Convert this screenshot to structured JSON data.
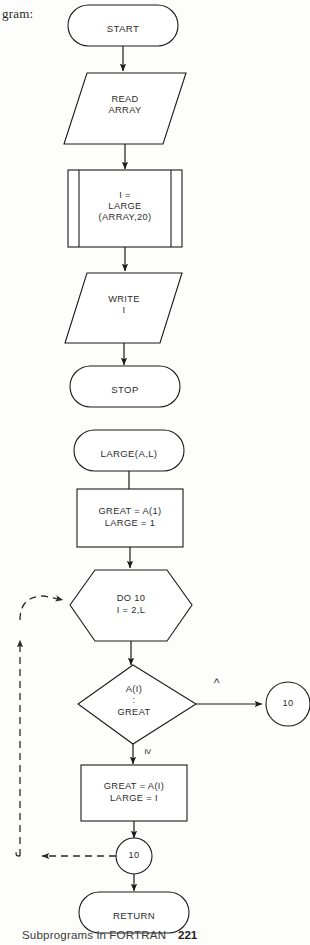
{
  "page": {
    "caption_fragment": "gram:",
    "footer_title": "Subprograms in FORTRAN",
    "footer_page": "221"
  },
  "main_flowchart": {
    "title": "main-program-flowchart",
    "nodes": [
      {
        "id": "start",
        "type": "terminal",
        "label": "START"
      },
      {
        "id": "read",
        "type": "input-output",
        "line1": "READ",
        "line2": "ARRAY"
      },
      {
        "id": "call",
        "type": "predefined-process",
        "line1": "I =",
        "line2": "LARGE",
        "line3": "(ARRAY,20)"
      },
      {
        "id": "write",
        "type": "input-output",
        "line1": "WRITE",
        "line2": "I"
      },
      {
        "id": "stop",
        "type": "terminal",
        "label": "STOP"
      }
    ]
  },
  "subprogram_flowchart": {
    "title": "large-subprogram-flowchart",
    "nodes": [
      {
        "id": "large",
        "type": "terminal",
        "label": "LARGE(A,L)"
      },
      {
        "id": "init",
        "type": "process",
        "line1": "GREAT  =  A(1)",
        "line2": "LARGE  =  1"
      },
      {
        "id": "do",
        "type": "preparation",
        "line1": "DO 10",
        "line2": "I = 2,L"
      },
      {
        "id": "test",
        "type": "decision",
        "line1": "A(I)",
        "sep": ":",
        "line2": "GREAT"
      },
      {
        "id": "update",
        "type": "process",
        "line1": "GREAT = A(I)",
        "line2": "LARGE = I"
      },
      {
        "id": "conn_right",
        "type": "connector",
        "label": "10"
      },
      {
        "id": "conn_bottom",
        "type": "connector",
        "label": "10"
      },
      {
        "id": "return",
        "type": "terminal",
        "label": "RETURN"
      }
    ],
    "branch_labels": {
      "less_than": "<",
      "greater_equal": "≥"
    }
  },
  "colors": {
    "stroke": "#1a1a1a",
    "text": "#2b2b2b",
    "background": "#fdfdfc"
  }
}
